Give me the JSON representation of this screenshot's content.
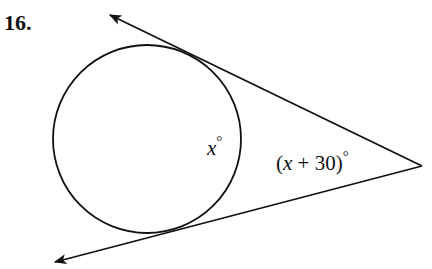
{
  "problem": {
    "number": "16."
  },
  "diagram": {
    "circle": {
      "cx": 147,
      "cy": 139,
      "r": 94
    },
    "vertex": {
      "x": 422,
      "y": 166
    },
    "tangent_upper": {
      "arrow_end": {
        "x": 110,
        "y": 15
      }
    },
    "tangent_lower": {
      "arrow_end": {
        "x": 55,
        "y": 262
      }
    },
    "labels": {
      "arc_label_var": "x",
      "arc_label_deg": "°",
      "angle_label": "(x + 30)°",
      "angle_label_open": "(",
      "angle_label_var": "x",
      "angle_label_rest": " + 30)",
      "angle_label_deg": "°"
    },
    "stroke_color": "#111111"
  }
}
